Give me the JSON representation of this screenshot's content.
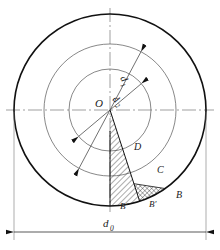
{
  "figure": {
    "type": "engineering-section-diagram"
  },
  "geometry": {
    "center": {
      "x": 110,
      "y": 110,
      "label": "O"
    },
    "circles": [
      {
        "name": "outer-circle",
        "radius": 96,
        "stroke_width": 1.6,
        "color": "#111111"
      },
      {
        "name": "middle-circle",
        "radius": 66,
        "stroke_width": 0.7,
        "color": "#555555"
      },
      {
        "name": "inner-circle",
        "radius": 41,
        "stroke_width": 0.7,
        "color": "#555555"
      }
    ],
    "centerlines": {
      "horizontal": {
        "name": "horizontal-centerline",
        "y": 110,
        "x1": 6,
        "x2": 214
      },
      "vertical": {
        "name": "vertical-centerline",
        "x": 110,
        "y1": 8,
        "y2": 212
      }
    },
    "radial_lines": [
      {
        "name": "radial-line-to-D",
        "angle_deg": 72,
        "from_r": 0,
        "to_r": 96
      },
      {
        "name": "radial-line-to-Bpp",
        "angle_deg": 90,
        "from_r": 0,
        "to_r": 96
      }
    ]
  },
  "dimensions": {
    "d0": {
      "label": "d",
      "subscript": "0",
      "name": "outer-diameter-dimension",
      "orientation": "horizontal",
      "y": 232,
      "x1": 14,
      "x2": 206
    },
    "d1": {
      "label": "d",
      "subscript": "1",
      "name": "middle-diameter-dimension",
      "orientation": "diagonal",
      "angle_deg": 118,
      "radius": 66
    },
    "d2": {
      "label": "d",
      "subscript": "2",
      "name": "inner-diameter-dimension",
      "orientation": "diagonal",
      "angle_deg": 140,
      "radius": 41
    }
  },
  "regions": [
    {
      "name": "hatched-region",
      "fill": "diagonal-hatch",
      "label": "D",
      "label_x": 133,
      "label_y": 150
    },
    {
      "name": "cross-hatched-region",
      "fill": "cross-hatch",
      "label": "C",
      "label_x": 156,
      "label_y": 172
    }
  ],
  "point_labels": [
    {
      "name": "point-label-D",
      "text": "D",
      "x": 134,
      "y": 150
    },
    {
      "name": "point-label-C",
      "text": "C",
      "x": 157,
      "y": 173
    },
    {
      "name": "point-label-B",
      "text": "B",
      "x": 176,
      "y": 198
    },
    {
      "name": "point-label-B-prime",
      "text": "B′",
      "x": 152,
      "y": 207
    },
    {
      "name": "point-label-B-dprime",
      "text": "B″",
      "x": 124,
      "y": 209
    },
    {
      "name": "point-label-O",
      "text": "O",
      "x": 95,
      "y": 107
    }
  ],
  "colors": {
    "ink": "#111111",
    "thin_ink": "#555555",
    "background": "#ffffff",
    "centerline": "#777777"
  }
}
